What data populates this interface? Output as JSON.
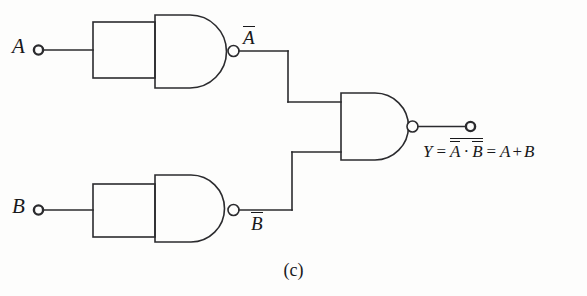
{
  "figure": {
    "caption": "(c)"
  },
  "inputs": [
    {
      "name": "input-a",
      "label": "A"
    },
    {
      "name": "input-b",
      "label": "B"
    }
  ],
  "wire_labels": {
    "not_a": "A",
    "not_b": "B"
  },
  "output": {
    "expression_lead": "Y",
    "equals": "=",
    "inner_a": "A",
    "dot": "·",
    "inner_b": "B",
    "equals2": "=",
    "result_a": "A",
    "plus": "+",
    "result_b": "B"
  },
  "gates": [
    {
      "name": "nand-gate-top",
      "type": "NAND",
      "role": "inverter-a"
    },
    {
      "name": "nand-gate-bottom",
      "type": "NAND",
      "role": "inverter-b"
    },
    {
      "name": "nand-gate-output",
      "type": "NAND",
      "role": "combiner"
    }
  ],
  "colors": {
    "line": "#2b2b2e",
    "background": "#fdfdfc",
    "text": "#18181a"
  }
}
